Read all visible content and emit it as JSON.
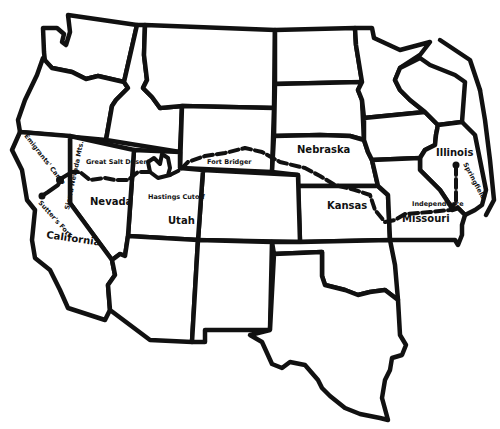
{
  "map": {
    "type": "Historical route map of the western and central United States (line drawing)",
    "colors": {
      "ink": "#111111",
      "background": "#ffffff"
    },
    "state_labels": [
      {
        "id": "nebraska",
        "text": "Nebraska"
      },
      {
        "id": "kansas",
        "text": "Kansas"
      },
      {
        "id": "illinois",
        "text": "Illinois"
      },
      {
        "id": "missouri",
        "text": "Missouri"
      },
      {
        "id": "nevada",
        "text": "Nevada"
      },
      {
        "id": "utah",
        "text": "Utah"
      },
      {
        "id": "california",
        "text": "California"
      }
    ],
    "place_labels": [
      {
        "id": "emigrants-camp",
        "text": "Emigrants' Camp"
      },
      {
        "id": "sierra-nevada",
        "text": "Sierra Nevada Mts."
      },
      {
        "id": "sutters-fort",
        "text": "Sutter's Fort"
      },
      {
        "id": "great-salt-desert",
        "text": "Great Salt Desert"
      },
      {
        "id": "hastings-cutoff",
        "text": "Hastings Cutoff"
      },
      {
        "id": "fort-bridger",
        "text": "Fort Bridger"
      },
      {
        "id": "independence",
        "text": "Independence"
      },
      {
        "id": "springfield",
        "text": "Springfield"
      }
    ],
    "route": {
      "name": "Trail route",
      "start": "Springfield",
      "end": "Sutter's Fort",
      "waypoints": [
        "Springfield",
        "Independence",
        "Fort Bridger",
        "Hastings Cutoff",
        "Great Salt Desert",
        "Sierra Nevada Mts.",
        "Emigrants' Camp",
        "Sutter's Fort"
      ]
    }
  }
}
